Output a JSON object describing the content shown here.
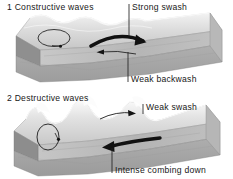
{
  "figure": {
    "background_color": "#ffffff",
    "ink_color": "#181818"
  },
  "panels": [
    {
      "id": "constructive",
      "number": "1",
      "caption": "1 Constructive waves",
      "wave_type": "low rolling waves, long wavelength, low height",
      "labels": [
        {
          "name": "strong-swash",
          "text": "Strong swash",
          "leader": "vertical line down to thick curved arrow",
          "arrow": "thick black curved arrow pointing up-beach (right)"
        },
        {
          "name": "weak-backwash",
          "text": "Weak backwash",
          "leader": "vertical line up to thin arrow",
          "arrow": "thin black arrow pointing down-beach (left)"
        }
      ],
      "orbital_motion": {
        "name": "circular-orbit",
        "shape": "flattened circle with clockwise arrow"
      }
    },
    {
      "id": "destructive",
      "number": "2",
      "caption": "2 Destructive waves",
      "wave_type": "tall steep plunging waves, short wavelength, high height",
      "labels": [
        {
          "name": "weak-swash",
          "text": "Weak swash",
          "leader": "vertical line down to thin curved arrow",
          "arrow": "thin black curved arrow pointing up-beach (right)"
        },
        {
          "name": "intense-combing-down",
          "text": "Intense combing down",
          "leader": "vertical line up to thick arrow",
          "arrow": "thick black arrow pointing down-beach (left)"
        }
      ],
      "orbital_motion": {
        "name": "elliptical-orbit",
        "shape": "upright ellipse with clockwise arrow"
      }
    }
  ],
  "colors": {
    "water_light": "#e6e6e6",
    "water_mid": "#cfcfcf",
    "beach_face": "#b4b4b4",
    "block_side": "#9a9a9a",
    "block_front": "#a8a8a8",
    "foam": "#f4f4f4",
    "arrow": "#141414"
  }
}
